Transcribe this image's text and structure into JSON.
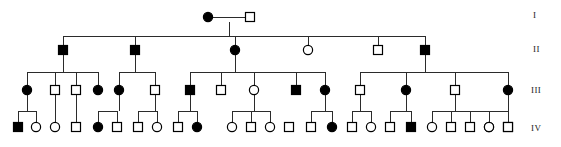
{
  "figure": {
    "width": 561,
    "height": 147,
    "background_color": "#ffffff",
    "line_color": "#2b2b2b",
    "symbol_stroke_color": "#000000",
    "affected_fill": "#000000",
    "unaffected_fill": "#ffffff"
  },
  "legend_semantics": {
    "square": "male",
    "circle": "female",
    "filled": "affected",
    "open": "unaffected"
  },
  "generation_labels": [
    {
      "text": "I",
      "x": 533,
      "y": 18
    },
    {
      "text": "II",
      "x": 533,
      "y": 52
    },
    {
      "text": "III",
      "x": 531,
      "y": 93
    },
    {
      "text": "IV",
      "x": 531,
      "y": 131
    }
  ],
  "geometry": {
    "row_y": {
      "I": 17,
      "II": 50,
      "III": 90,
      "IV": 127
    },
    "symbol_size": 9,
    "circle_radius": 4.6
  },
  "individuals": [
    {
      "id": "I-1",
      "gen": "I",
      "sex": "female",
      "affected": true,
      "x": 208,
      "y": 17
    },
    {
      "id": "I-2",
      "gen": "I",
      "sex": "male",
      "affected": false,
      "x": 250,
      "y": 17
    },
    {
      "id": "II-1",
      "gen": "II",
      "sex": "male",
      "affected": true,
      "x": 63,
      "y": 50
    },
    {
      "id": "II-2",
      "gen": "II",
      "sex": "male",
      "affected": true,
      "x": 135,
      "y": 50
    },
    {
      "id": "II-3",
      "gen": "II",
      "sex": "female",
      "affected": true,
      "x": 235,
      "y": 50
    },
    {
      "id": "II-4",
      "gen": "II",
      "sex": "female",
      "affected": false,
      "x": 308,
      "y": 50
    },
    {
      "id": "II-5",
      "gen": "II",
      "sex": "male",
      "affected": false,
      "x": 378,
      "y": 50
    },
    {
      "id": "II-6",
      "gen": "II",
      "sex": "male",
      "affected": true,
      "x": 425,
      "y": 50
    },
    {
      "id": "III-1",
      "gen": "III",
      "sex": "female",
      "affected": true,
      "x": 27,
      "y": 90
    },
    {
      "id": "III-2",
      "gen": "III",
      "sex": "male",
      "affected": false,
      "x": 55,
      "y": 90
    },
    {
      "id": "III-3",
      "gen": "III",
      "sex": "male",
      "affected": false,
      "x": 76,
      "y": 90
    },
    {
      "id": "III-4",
      "gen": "III",
      "sex": "female",
      "affected": true,
      "x": 98,
      "y": 90
    },
    {
      "id": "III-5",
      "gen": "III",
      "sex": "female",
      "affected": true,
      "x": 119,
      "y": 90
    },
    {
      "id": "III-6",
      "gen": "III",
      "sex": "male",
      "affected": false,
      "x": 155,
      "y": 90
    },
    {
      "id": "III-7",
      "gen": "III",
      "sex": "male",
      "affected": true,
      "x": 190,
      "y": 90
    },
    {
      "id": "III-8",
      "gen": "III",
      "sex": "male",
      "affected": false,
      "x": 221,
      "y": 90
    },
    {
      "id": "III-9",
      "gen": "III",
      "sex": "female",
      "affected": false,
      "x": 254,
      "y": 90
    },
    {
      "id": "III-10",
      "gen": "III",
      "sex": "male",
      "affected": true,
      "x": 296,
      "y": 90
    },
    {
      "id": "III-11",
      "gen": "III",
      "sex": "female",
      "affected": true,
      "x": 325,
      "y": 90
    },
    {
      "id": "III-12",
      "gen": "III",
      "sex": "male",
      "affected": false,
      "x": 360,
      "y": 90
    },
    {
      "id": "III-13",
      "gen": "III",
      "sex": "female",
      "affected": true,
      "x": 406,
      "y": 90
    },
    {
      "id": "III-14",
      "gen": "III",
      "sex": "male",
      "affected": false,
      "x": 455,
      "y": 90
    },
    {
      "id": "III-15",
      "gen": "III",
      "sex": "female",
      "affected": true,
      "x": 508,
      "y": 90
    },
    {
      "id": "IV-1",
      "gen": "IV",
      "sex": "male",
      "affected": true,
      "x": 18,
      "y": 127
    },
    {
      "id": "IV-2",
      "gen": "IV",
      "sex": "female",
      "affected": false,
      "x": 36,
      "y": 127
    },
    {
      "id": "IV-3",
      "gen": "IV",
      "sex": "female",
      "affected": false,
      "x": 55,
      "y": 127
    },
    {
      "id": "IV-4",
      "gen": "IV",
      "sex": "male",
      "affected": false,
      "x": 76,
      "y": 127
    },
    {
      "id": "IV-5",
      "gen": "IV",
      "sex": "female",
      "affected": true,
      "x": 98,
      "y": 127
    },
    {
      "id": "IV-6",
      "gen": "IV",
      "sex": "male",
      "affected": false,
      "x": 117,
      "y": 127
    },
    {
      "id": "IV-7",
      "gen": "IV",
      "sex": "male",
      "affected": false,
      "x": 138,
      "y": 127
    },
    {
      "id": "IV-8",
      "gen": "IV",
      "sex": "female",
      "affected": false,
      "x": 157,
      "y": 127
    },
    {
      "id": "IV-9",
      "gen": "IV",
      "sex": "male",
      "affected": false,
      "x": 178,
      "y": 127
    },
    {
      "id": "IV-10",
      "gen": "IV",
      "sex": "female",
      "affected": true,
      "x": 197,
      "y": 127
    },
    {
      "id": "IV-11",
      "gen": "IV",
      "sex": "female",
      "affected": false,
      "x": 232,
      "y": 127
    },
    {
      "id": "IV-12",
      "gen": "IV",
      "sex": "male",
      "affected": false,
      "x": 251,
      "y": 127
    },
    {
      "id": "IV-13",
      "gen": "IV",
      "sex": "female",
      "affected": false,
      "x": 270,
      "y": 127
    },
    {
      "id": "IV-14",
      "gen": "IV",
      "sex": "male",
      "affected": false,
      "x": 289,
      "y": 127
    },
    {
      "id": "IV-15",
      "gen": "IV",
      "sex": "male",
      "affected": false,
      "x": 311,
      "y": 127
    },
    {
      "id": "IV-16",
      "gen": "IV",
      "sex": "female",
      "affected": true,
      "x": 332,
      "y": 127
    },
    {
      "id": "IV-17",
      "gen": "IV",
      "sex": "male",
      "affected": false,
      "x": 352,
      "y": 127
    },
    {
      "id": "IV-18",
      "gen": "IV",
      "sex": "female",
      "affected": false,
      "x": 371,
      "y": 127
    },
    {
      "id": "IV-19",
      "gen": "IV",
      "sex": "male",
      "affected": false,
      "x": 390,
      "y": 127
    },
    {
      "id": "IV-20",
      "gen": "IV",
      "sex": "male",
      "affected": true,
      "x": 411,
      "y": 127
    },
    {
      "id": "IV-21",
      "gen": "IV",
      "sex": "female",
      "affected": false,
      "x": 432,
      "y": 127
    },
    {
      "id": "IV-22",
      "gen": "IV",
      "sex": "male",
      "affected": false,
      "x": 451,
      "y": 127
    },
    {
      "id": "IV-23",
      "gen": "IV",
      "sex": "male",
      "affected": false,
      "x": 470,
      "y": 127
    },
    {
      "id": "IV-24",
      "gen": "IV",
      "sex": "female",
      "affected": false,
      "x": 489,
      "y": 127
    },
    {
      "id": "IV-25",
      "gen": "IV",
      "sex": "male",
      "affected": false,
      "x": 508,
      "y": 127
    },
    {
      "id": "IV-26",
      "gen": "IV",
      "sex": "female",
      "affected": false,
      "x": 489,
      "y": 127
    },
    {
      "id": "IV-27",
      "gen": "IV",
      "sex": "male",
      "affected": false,
      "x": 508,
      "y": 127
    }
  ],
  "couples": [
    {
      "id": "couple-I",
      "left_x": 208,
      "right_x": 250,
      "y": 17,
      "drop_x": 229
    }
  ],
  "sibships": [
    {
      "id": "sibship-I",
      "parent_drop_x": 229,
      "parent_drop_from_y": 17,
      "bar_y": 36,
      "child_xs": [
        63,
        135,
        235,
        308,
        378,
        425
      ],
      "child_top_y": 50
    },
    {
      "id": "sibship-II-1",
      "parent_drop_x": 63,
      "parent_drop_from_y": 50,
      "bar_y": 72,
      "child_xs": [
        27,
        55,
        76,
        98
      ],
      "child_top_y": 90
    },
    {
      "id": "sibship-II-2",
      "parent_drop_x": 135,
      "parent_drop_from_y": 50,
      "bar_y": 72,
      "child_xs": [
        119,
        155
      ],
      "child_top_y": 90
    },
    {
      "id": "sibship-II-3",
      "parent_drop_x": 235,
      "parent_drop_from_y": 50,
      "bar_y": 72,
      "child_xs": [
        190,
        221,
        254,
        296,
        325
      ],
      "child_top_y": 90
    },
    {
      "id": "sibship-II-6",
      "parent_drop_x": 425,
      "parent_drop_from_y": 50,
      "bar_y": 72,
      "child_xs": [
        360,
        406,
        455,
        508
      ],
      "child_top_y": 90
    },
    {
      "id": "sibship-III-1",
      "parent_drop_x": 27,
      "parent_drop_from_y": 90,
      "bar_y": 111,
      "child_xs": [
        18,
        36
      ],
      "child_top_y": 127
    },
    {
      "id": "sibship-III-2",
      "parent_drop_x": 55,
      "parent_drop_from_y": 90,
      "bar_y": 111,
      "child_xs": [
        55
      ],
      "child_top_y": 127
    },
    {
      "id": "sibship-III-3",
      "parent_drop_x": 76,
      "parent_drop_from_y": 90,
      "bar_y": 111,
      "child_xs": [
        76
      ],
      "child_top_y": 127
    },
    {
      "id": "sibship-III-5",
      "parent_drop_x": 119,
      "parent_drop_from_y": 90,
      "bar_y": 111,
      "child_xs": [
        98,
        117
      ],
      "child_top_y": 127
    },
    {
      "id": "sibship-III-6",
      "parent_drop_x": 155,
      "parent_drop_from_y": 90,
      "bar_y": 111,
      "child_xs": [
        138,
        157
      ],
      "child_top_y": 127
    },
    {
      "id": "sibship-III-7",
      "parent_drop_x": 190,
      "parent_drop_from_y": 90,
      "bar_y": 111,
      "child_xs": [
        178,
        197
      ],
      "child_top_y": 127
    },
    {
      "id": "sibship-III-9",
      "parent_drop_x": 254,
      "parent_drop_from_y": 90,
      "bar_y": 111,
      "child_xs": [
        232,
        251,
        270
      ],
      "child_top_y": 127
    },
    {
      "id": "sibship-III-11",
      "parent_drop_x": 325,
      "parent_drop_from_y": 90,
      "bar_y": 111,
      "child_xs": [
        311,
        332
      ],
      "child_top_y": 127
    },
    {
      "id": "sibship-III-12",
      "parent_drop_x": 360,
      "parent_drop_from_y": 90,
      "bar_y": 111,
      "child_xs": [
        352,
        371
      ],
      "child_top_y": 127
    },
    {
      "id": "sibship-III-13",
      "parent_drop_x": 406,
      "parent_drop_from_y": 90,
      "bar_y": 111,
      "child_xs": [
        390,
        411
      ],
      "child_top_y": 127
    },
    {
      "id": "sibship-III-14",
      "parent_drop_x": 455,
      "parent_drop_from_y": 90,
      "bar_y": 111,
      "child_xs": [
        432,
        451,
        470,
        489
      ],
      "child_top_y": 127
    },
    {
      "id": "sibship-III-15",
      "parent_drop_x": 508,
      "parent_drop_from_y": 90,
      "bar_y": 111,
      "child_xs": [
        489,
        508
      ],
      "child_top_y": 127
    }
  ]
}
